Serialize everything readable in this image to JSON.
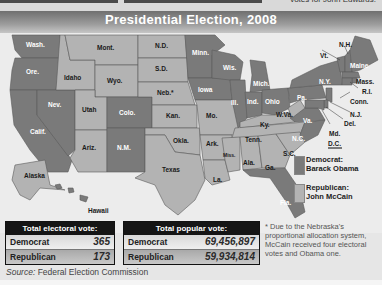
{
  "header": {
    "title": "Presidential Election, 2008",
    "top_snippet": "votes for John Edwards."
  },
  "colors": {
    "democrat": "#7a7a7a",
    "republican": "#b3b3b3",
    "title_bar": "#8a8a8a",
    "table_header": "#151515"
  },
  "map": {
    "states": [
      {
        "abbr": "Wash.",
        "party": "democrat"
      },
      {
        "abbr": "Ore.",
        "party": "democrat"
      },
      {
        "abbr": "Calif.",
        "party": "democrat"
      },
      {
        "abbr": "Nev.",
        "party": "democrat"
      },
      {
        "abbr": "Idaho",
        "party": "republican"
      },
      {
        "abbr": "Mont.",
        "party": "republican"
      },
      {
        "abbr": "Wyo.",
        "party": "republican"
      },
      {
        "abbr": "Utah",
        "party": "republican"
      },
      {
        "abbr": "Colo.",
        "party": "democrat"
      },
      {
        "abbr": "Ariz.",
        "party": "republican"
      },
      {
        "abbr": "N.M.",
        "party": "democrat"
      },
      {
        "abbr": "N.D.",
        "party": "republican"
      },
      {
        "abbr": "S.D.",
        "party": "republican"
      },
      {
        "abbr": "Neb.*",
        "party": "republican"
      },
      {
        "abbr": "Kan.",
        "party": "republican"
      },
      {
        "abbr": "Okla.",
        "party": "republican"
      },
      {
        "abbr": "Texas",
        "party": "republican"
      },
      {
        "abbr": "Minn.",
        "party": "democrat"
      },
      {
        "abbr": "Iowa",
        "party": "democrat"
      },
      {
        "abbr": "Mo.",
        "party": "republican"
      },
      {
        "abbr": "Ark.",
        "party": "republican"
      },
      {
        "abbr": "La.",
        "party": "republican"
      },
      {
        "abbr": "Wis.",
        "party": "democrat"
      },
      {
        "abbr": "Ill.",
        "party": "democrat"
      },
      {
        "abbr": "Mich.",
        "party": "democrat"
      },
      {
        "abbr": "Ind.",
        "party": "democrat"
      },
      {
        "abbr": "Ohio",
        "party": "democrat"
      },
      {
        "abbr": "Ky.",
        "party": "republican"
      },
      {
        "abbr": "Tenn.",
        "party": "republican"
      },
      {
        "abbr": "Miss.",
        "party": "republican"
      },
      {
        "abbr": "Ala.",
        "party": "republican"
      },
      {
        "abbr": "Ga.",
        "party": "republican"
      },
      {
        "abbr": "Fla.",
        "party": "democrat"
      },
      {
        "abbr": "S.C.",
        "party": "republican"
      },
      {
        "abbr": "N.C.",
        "party": "democrat"
      },
      {
        "abbr": "Va.",
        "party": "democrat"
      },
      {
        "abbr": "W.Va.",
        "party": "republican"
      },
      {
        "abbr": "Pa.",
        "party": "democrat"
      },
      {
        "abbr": "N.Y.",
        "party": "democrat"
      },
      {
        "abbr": "Vt.",
        "party": "democrat"
      },
      {
        "abbr": "N.H.",
        "party": "democrat"
      },
      {
        "abbr": "Maine",
        "party": "democrat"
      },
      {
        "abbr": "Mass.",
        "party": "democrat"
      },
      {
        "abbr": "R.I.",
        "party": "democrat"
      },
      {
        "abbr": "Conn.",
        "party": "democrat"
      },
      {
        "abbr": "N.J.",
        "party": "democrat"
      },
      {
        "abbr": "Del.",
        "party": "democrat"
      },
      {
        "abbr": "Md.",
        "party": "democrat"
      },
      {
        "abbr": "D.C.",
        "party": "democrat"
      },
      {
        "abbr": "Alaska",
        "party": "republican"
      },
      {
        "abbr": "Hawaii",
        "party": "democrat"
      }
    ]
  },
  "legend": {
    "democrat": {
      "line1": "Democrat:",
      "line2": "Barack Obama"
    },
    "republican": {
      "line1": "Republican:",
      "line2": "John McCain"
    }
  },
  "electoral_table": {
    "header": "Total electoral vote:",
    "rows": [
      {
        "label": "Democrat",
        "value": "365"
      },
      {
        "label": "Republican",
        "value": "173"
      }
    ]
  },
  "popular_table": {
    "header": "Total popular vote:",
    "rows": [
      {
        "label": "Democrat",
        "value": "69,456,897"
      },
      {
        "label": "Republican",
        "value": "59,934,814"
      }
    ]
  },
  "source": {
    "prefix": "Source:",
    "text": " Federal Election Commission"
  },
  "footnote": "* Due to the Nebraska's proportional allocation system, McCain received four electoral votes and Obama one."
}
